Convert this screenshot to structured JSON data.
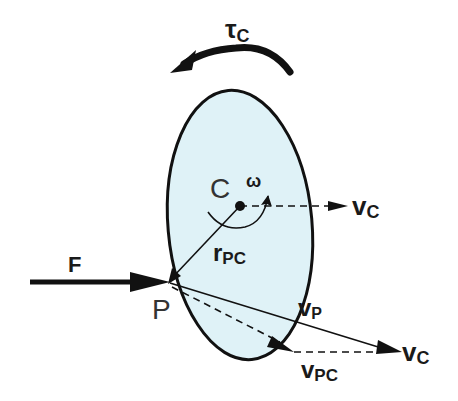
{
  "diagram": {
    "colors": {
      "body_fill": "#dff2f7",
      "stroke": "#111111",
      "background": "#ffffff"
    },
    "body": {
      "shape": "ellipse",
      "label": "rigid body"
    },
    "labels": {
      "torque": "τ",
      "torque_sub": "C",
      "center": "C",
      "omega": "ω",
      "force": "F",
      "point": "P",
      "r_main": "r",
      "r_sub": "PC",
      "vc_right_main": "v",
      "vc_right_sub": "C",
      "vp_main": "v",
      "vp_sub": "P",
      "vc_bottom_main": "v",
      "vc_bottom_sub": "C",
      "vpc_main": "v",
      "vpc_sub": "PC"
    },
    "elements": [
      "torque-arc-arrow",
      "ellipse-body",
      "center-point-C",
      "angular-velocity-arc",
      "velocity-vC-dashed",
      "position-vector-rPC",
      "force-arrow-F",
      "contact-point-P",
      "velocity-vP",
      "velocity-vPC-dashed",
      "velocity-vC-dashed-bottom"
    ]
  }
}
